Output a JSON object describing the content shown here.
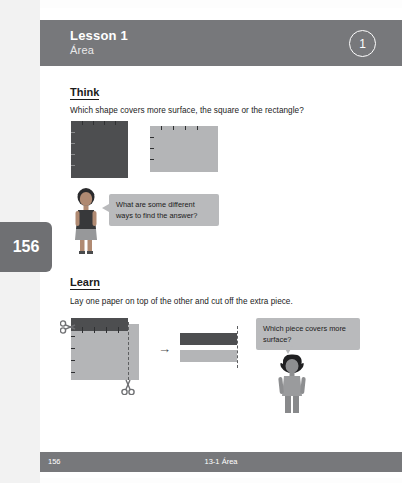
{
  "header": {
    "title": "Lesson 1",
    "subtitle": "Área",
    "badge": "1"
  },
  "page_tab": {
    "number": "156"
  },
  "think": {
    "heading": "Think",
    "prompt": "Which shape covers more surface, the square or the rectangle?",
    "bubble": "What are some different ways to find the answer?"
  },
  "learn": {
    "heading": "Learn",
    "prompt": "Lay one paper on top of the other and cut off the extra piece.",
    "bubble": "Which piece covers more surface?"
  },
  "footer": {
    "page": "156",
    "center": "13-1 Área"
  },
  "icons": {
    "arrow": "→",
    "scissors": "✂"
  },
  "colors": {
    "band": "#77787b",
    "dark_shape": "#4d4e50",
    "light_shape": "#b4b5b7",
    "bubble": "#b9babc"
  }
}
